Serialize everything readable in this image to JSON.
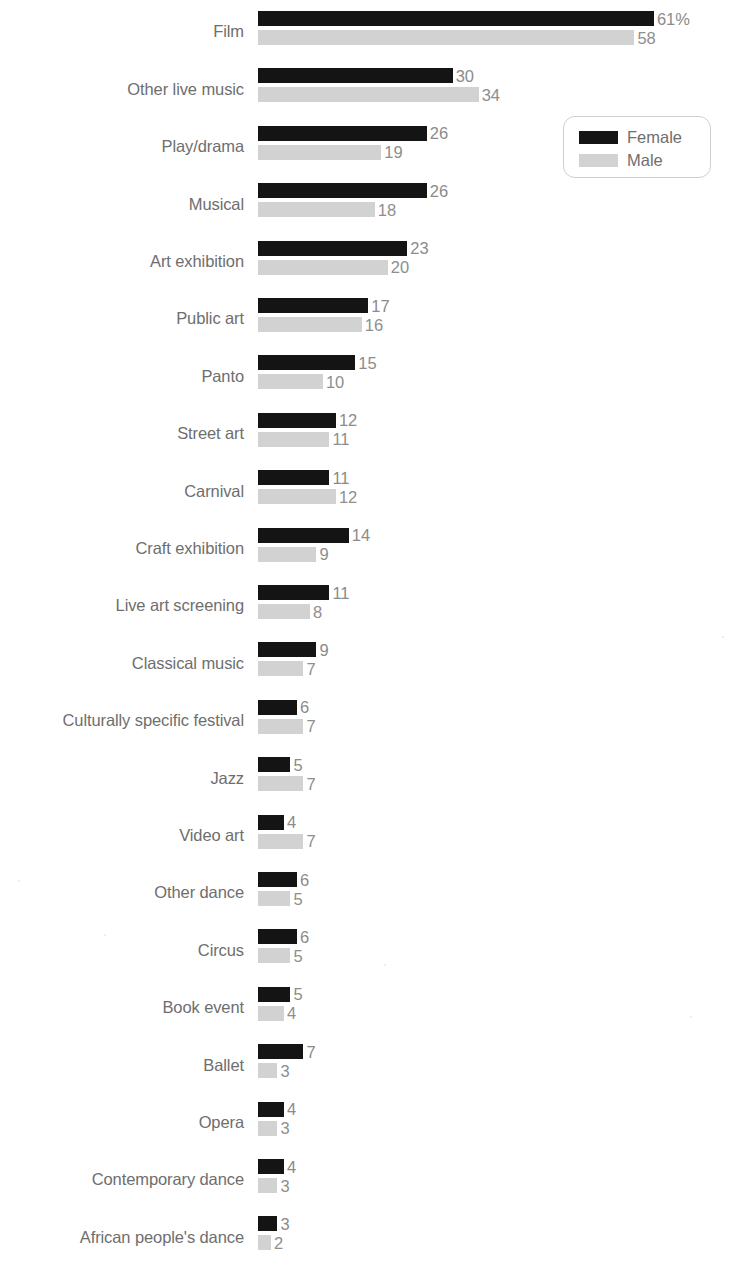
{
  "chart_data": {
    "type": "bar",
    "orientation": "horizontal",
    "title": "",
    "subtitle": "",
    "xlabel": "",
    "ylabel": "",
    "grid": false,
    "xlim": [
      0,
      61
    ],
    "legend_position": "top-right",
    "categories": [
      "Film",
      "Other live music",
      "Play/drama",
      "Musical",
      "Art exhibition",
      "Public art",
      "Panto",
      "Street art",
      "Carnival",
      "Craft exhibition",
      "Live art screening",
      "Classical music",
      "Culturally specific festival",
      "Jazz",
      "Video art",
      "Other dance",
      "Circus",
      "Book event",
      "Ballet",
      "Opera",
      "Contemporary dance",
      "African people's dance"
    ],
    "series": [
      {
        "name": "Female",
        "color": "#141414",
        "values": [
          61,
          30,
          26,
          26,
          23,
          17,
          15,
          12,
          11,
          14,
          11,
          9,
          6,
          5,
          4,
          6,
          6,
          5,
          7,
          4,
          4,
          3
        ],
        "labels": [
          "61%",
          "30",
          "26",
          "26",
          "23",
          "17",
          "15",
          "12",
          "11",
          "14",
          "11",
          "9",
          "6",
          "5",
          "4",
          "6",
          "6",
          "5",
          "7",
          "4",
          "4",
          "3"
        ]
      },
      {
        "name": "Male",
        "color": "#d2d2d2",
        "values": [
          58,
          34,
          19,
          18,
          20,
          16,
          10,
          11,
          12,
          9,
          8,
          7,
          7,
          7,
          7,
          5,
          5,
          4,
          3,
          3,
          3,
          2
        ],
        "labels": [
          "58",
          "34",
          "19",
          "18",
          "20",
          "16",
          "10",
          "11",
          "12",
          "9",
          "8",
          "7",
          "7",
          "7",
          "7",
          "5",
          "5",
          "4",
          "3",
          "3",
          "3",
          "2"
        ]
      }
    ]
  },
  "legend": {
    "items": [
      {
        "label": "Female",
        "swatch": "female"
      },
      {
        "label": "Male",
        "swatch": "male"
      }
    ]
  },
  "colors": {
    "female": "#141414",
    "male": "#d2d2d2",
    "label_text": "#6e6e6e",
    "value_text": "#8b8b8b",
    "background": "#ffffff"
  }
}
